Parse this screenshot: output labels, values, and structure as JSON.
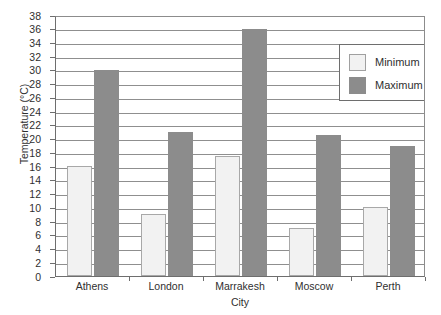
{
  "chart_data": {
    "type": "bar",
    "title": "",
    "xlabel": "City",
    "ylabel": "Temperature (°C)",
    "categories": [
      "Athens",
      "London",
      "Marrakesh",
      "Moscow",
      "Perth"
    ],
    "series": [
      {
        "name": "Minimum",
        "values": [
          16,
          9,
          17.5,
          7,
          10
        ],
        "color": "#f2f2f2"
      },
      {
        "name": "Maximum",
        "values": [
          30,
          21,
          36,
          20.5,
          19
        ],
        "color": "#8c8c8c"
      }
    ],
    "ylim": [
      0,
      38
    ],
    "ytick_step": 2,
    "yticks": [
      0,
      2,
      4,
      6,
      8,
      10,
      12,
      14,
      16,
      18,
      20,
      22,
      24,
      26,
      28,
      30,
      32,
      34,
      36,
      38
    ],
    "ytick_labels": [
      "0",
      "2",
      "4",
      "6",
      "8",
      "10",
      "12",
      "14",
      "16",
      "18",
      "20",
      "22",
      "24",
      "26",
      "28",
      "30",
      "32",
      "34",
      "36",
      "38"
    ],
    "grid": {
      "horizontal": true,
      "vertical": false,
      "color": "#8f8f8f"
    },
    "legend": {
      "position": "top-right-inside",
      "entries": [
        {
          "label": "Minimum",
          "swatch": "#f2f2f2"
        },
        {
          "label": "Maximum",
          "swatch": "#8c8c8c"
        }
      ]
    },
    "axis_color": "#6e6e6e",
    "background": "#ffffff"
  }
}
